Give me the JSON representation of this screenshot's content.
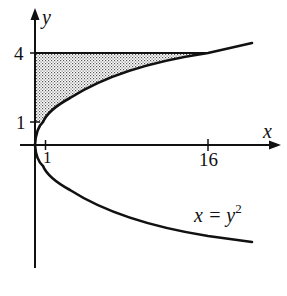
{
  "diagram": {
    "type": "region-between-curves",
    "curve": {
      "equation_label": "x = y",
      "equation_exponent": "2",
      "description": "sideways parabola x = y^2"
    },
    "axes": {
      "x_label": "x",
      "y_label": "y",
      "x_ticks": [
        {
          "value": 1,
          "label": "1"
        },
        {
          "value": 16,
          "label": "16"
        }
      ],
      "y_ticks": [
        {
          "value": 1,
          "label": "1"
        },
        {
          "value": 4,
          "label": "4"
        }
      ]
    },
    "shaded_region": {
      "description": "region bounded by x = y^2, the y-axis, and the line y = 4, between y = 1 and y = 4",
      "bounds": {
        "y_min": 1,
        "y_max": 4,
        "left": "x = 0",
        "right": "x = y^2"
      }
    },
    "horizontal_line": {
      "y": 4,
      "x_from": 0,
      "x_to": 16
    },
    "colors": {
      "ink": "#111111",
      "shade": "#bdbdbd",
      "background": "#ffffff"
    }
  }
}
